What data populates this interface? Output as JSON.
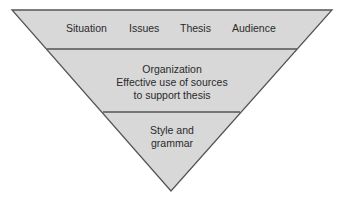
{
  "diagram": {
    "type": "inverted-pyramid",
    "colors": {
      "fill": "#d8d8d8",
      "stroke": "#555555",
      "text": "#2a2a2a"
    },
    "tiers": [
      {
        "level": 1,
        "items": [
          "Situation",
          "Issues",
          "Thesis",
          "Audience"
        ]
      },
      {
        "level": 2,
        "lines": [
          "Organization",
          "Effective use of sources",
          "to support thesis"
        ]
      },
      {
        "level": 3,
        "lines": [
          "Style and",
          "grammar"
        ]
      }
    ]
  }
}
